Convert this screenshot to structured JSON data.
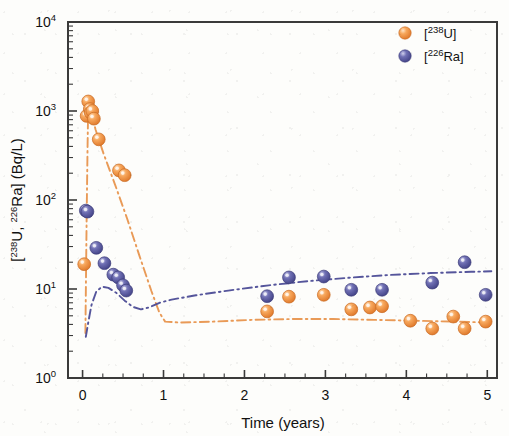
{
  "chart_data": {
    "type": "scatter",
    "title": "",
    "xlabel": "Time (years)",
    "ylabel": "[238U, 226Ra] (Bq/L)",
    "ylabel_parts": {
      "open": "[",
      "sup1": "238",
      "el1": "U, ",
      "sup2": "226",
      "el2": "Ra] (Bq/L)"
    },
    "xlim": [
      -0.18,
      5.12
    ],
    "ylim": [
      1,
      10000
    ],
    "yscale": "log",
    "xscale": "linear",
    "grid": false,
    "legend_position": "top-right",
    "xticks": [
      0,
      1,
      2,
      3,
      4,
      5
    ],
    "xtick_labels": [
      "0",
      "1",
      "2",
      "3",
      "4",
      "5"
    ],
    "xminor_step": 0.25,
    "yticks": [
      1,
      10,
      100,
      1000,
      10000
    ],
    "ytick_labels": [
      "10⁰",
      "10¹",
      "10²",
      "10³",
      "10⁴"
    ],
    "ytick_exponents": [
      "0",
      "1",
      "2",
      "3",
      "4"
    ],
    "ytick_mantissa": "10",
    "series": [
      {
        "name": "[238U]",
        "label_open": "[",
        "label_sup": "238",
        "label_el": "U]",
        "color": "#F08A3C",
        "highlight": "#FBD2A6",
        "edge": "#C96A22",
        "marker": "sphere",
        "points": [
          [
            0.02,
            19
          ],
          [
            0.05,
            880
          ],
          [
            0.07,
            1280
          ],
          [
            0.09,
            1050
          ],
          [
            0.1,
            960
          ],
          [
            0.12,
            1000
          ],
          [
            0.14,
            820
          ],
          [
            0.2,
            480
          ],
          [
            0.45,
            215
          ],
          [
            0.52,
            190
          ],
          [
            2.28,
            5.6
          ],
          [
            2.55,
            8.2
          ],
          [
            2.98,
            8.6
          ],
          [
            3.32,
            5.9
          ],
          [
            3.55,
            6.2
          ],
          [
            3.7,
            6.4
          ],
          [
            4.05,
            4.4
          ],
          [
            4.32,
            3.6
          ],
          [
            4.58,
            4.9
          ],
          [
            4.72,
            3.6
          ],
          [
            4.98,
            4.3
          ]
        ]
      },
      {
        "name": "[226Ra]",
        "label_open": "[",
        "label_sup": "226",
        "label_el": "Ra]",
        "color": "#5B5BA5",
        "highlight": "#B6B6DC",
        "edge": "#3C3C78",
        "marker": "sphere",
        "points": [
          [
            0.04,
            76
          ],
          [
            0.06,
            74
          ],
          [
            0.17,
            29
          ],
          [
            0.27,
            19.5
          ],
          [
            0.38,
            14.5
          ],
          [
            0.44,
            13.5
          ],
          [
            0.5,
            11.0
          ],
          [
            0.54,
            9.6
          ],
          [
            2.28,
            8.3
          ],
          [
            2.55,
            13.5
          ],
          [
            2.98,
            13.8
          ],
          [
            3.32,
            9.8
          ],
          [
            3.7,
            9.8
          ],
          [
            4.32,
            11.8
          ],
          [
            4.72,
            20.0
          ],
          [
            4.98,
            8.6
          ]
        ]
      }
    ],
    "model_curves": [
      {
        "name": "[238U] model",
        "color": "#E8954E",
        "style": "dash-dot",
        "points": [
          [
            0.035,
            3.2
          ],
          [
            0.05,
            60
          ],
          [
            0.062,
            420
          ],
          [
            0.07,
            1150
          ],
          [
            0.078,
            1320
          ],
          [
            0.1,
            1050
          ],
          [
            0.16,
            620
          ],
          [
            0.26,
            330
          ],
          [
            0.4,
            150
          ],
          [
            0.55,
            62
          ],
          [
            0.7,
            24
          ],
          [
            0.85,
            9.5
          ],
          [
            0.95,
            5.4
          ],
          [
            1.02,
            4.3
          ],
          [
            1.2,
            4.2
          ],
          [
            1.6,
            4.3
          ],
          [
            2.1,
            4.5
          ],
          [
            2.6,
            4.6
          ],
          [
            3.1,
            4.6
          ],
          [
            3.6,
            4.5
          ],
          [
            4.1,
            4.4
          ],
          [
            4.6,
            4.3
          ],
          [
            5.05,
            4.2
          ]
        ]
      },
      {
        "name": "[226Ra] model",
        "color": "#4C4C96",
        "style": "dash-dot",
        "points": [
          [
            0.04,
            2.9
          ],
          [
            0.07,
            4.2
          ],
          [
            0.11,
            6.6
          ],
          [
            0.17,
            9.4
          ],
          [
            0.24,
            10.6
          ],
          [
            0.32,
            10.3
          ],
          [
            0.42,
            9.0
          ],
          [
            0.52,
            7.4
          ],
          [
            0.62,
            6.3
          ],
          [
            0.72,
            5.9
          ],
          [
            0.82,
            6.2
          ],
          [
            0.95,
            7.0
          ],
          [
            1.1,
            7.6
          ],
          [
            1.4,
            8.5
          ],
          [
            1.8,
            9.6
          ],
          [
            2.3,
            11.0
          ],
          [
            2.8,
            12.3
          ],
          [
            3.3,
            13.4
          ],
          [
            3.8,
            14.4
          ],
          [
            4.3,
            15.1
          ],
          [
            4.8,
            15.6
          ],
          [
            5.05,
            15.8
          ]
        ]
      }
    ]
  }
}
